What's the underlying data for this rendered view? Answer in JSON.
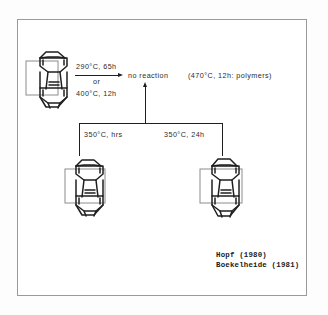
{
  "figure": {
    "type": "chemical-reaction-scheme",
    "background_color": "#ffffff",
    "frame_color": "#9a9a9a",
    "ink_color": "#1f1f1f"
  },
  "reaction": {
    "forward_conditions_line1": "290°C, 65h",
    "forward_conditions_or": "or",
    "forward_conditions_line2": "400°C, 12h",
    "outcome": "no reaction",
    "note": "(470°C, 12h: polymers)"
  },
  "branches": {
    "left_label": "350°C, hrs",
    "right_label": "350°C, 24h"
  },
  "citations": [
    "Hopf (1980)",
    "Boekelheide (1981)"
  ],
  "structures": {
    "reactant": "cyclophane-reactant",
    "product_left": "cyclophane-product-left",
    "product_right": "cyclophane-product-right"
  }
}
